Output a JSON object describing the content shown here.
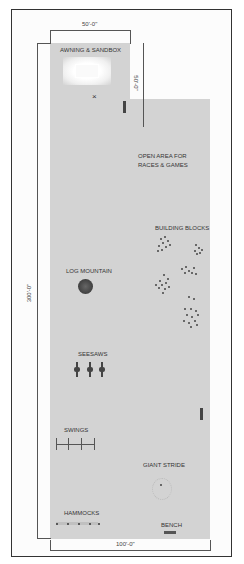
{
  "dimensions": {
    "top_width": "50'-0\"",
    "top_height": "50'-0\"",
    "total_height": "300'-0\"",
    "bottom_width": "100'-0\""
  },
  "zones": {
    "awning_sandbox": "AWNING & SANDBOX",
    "open_area_line1": "OPEN AREA FOR",
    "open_area_line2": "RACES & GAMES",
    "building_blocks": "BUILDING BLOCKS",
    "log_mountain": "LOG MOUNTAIN",
    "seesaws": "SEESAWS",
    "swings": "SWINGS",
    "giant_stride": "GIANT STRIDE",
    "hammocks": "HAMMOCKS",
    "bench": "BENCH"
  },
  "colors": {
    "ground": "#d3d3d3",
    "border": "#333333",
    "equipment": "#444444"
  }
}
